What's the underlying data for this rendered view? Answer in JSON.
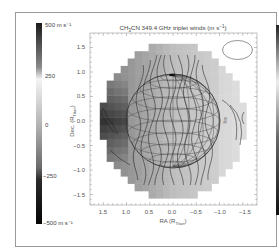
{
  "figure": {
    "colorbar": {
      "top_label": "500 m s⁻¹",
      "bottom_label": "−500 m s⁻¹",
      "tick_labels": [
        "250",
        "0",
        "−250"
      ],
      "range": [
        -500,
        500
      ]
    },
    "xaxis": {
      "label": "RA (R",
      "label_sub": "Titan",
      "label_end": ")",
      "ticks": [
        "1.5",
        "1.0",
        "0.5",
        "0.0",
        "−0.5",
        "−1.0",
        "−1.5"
      ]
    },
    "yaxis": {
      "label": "Dec. (R",
      "label_sub": "Titan",
      "label_end": ")",
      "ticks": [
        "1.5",
        "1.0",
        "0.5",
        "0.0",
        "−0.5",
        "−1.0",
        "−1.5"
      ]
    },
    "contour_label_example": "200"
  },
  "chart_data": {
    "type": "heatmap",
    "xlabel": "RA (R_Titan)",
    "ylabel": "Dec. (R_Titan)",
    "xlim": [
      1.7,
      -1.7
    ],
    "ylim": [
      -1.7,
      1.7
    ],
    "x_ticks": [
      1.5,
      1.0,
      0.5,
      0.0,
      -0.5,
      -1.0,
      -1.5
    ],
    "y_ticks": [
      -1.5,
      -1.0,
      -0.5,
      0.0,
      0.5,
      1.0,
      1.5
    ],
    "colorbar": {
      "min": -500,
      "max": 500,
      "ticks": [
        -500,
        -250,
        0,
        250,
        500
      ],
      "unit": "m s^-1"
    },
    "annotations": [
      "200"
    ],
    "grid": false,
    "legend": "colorbar left"
  }
}
